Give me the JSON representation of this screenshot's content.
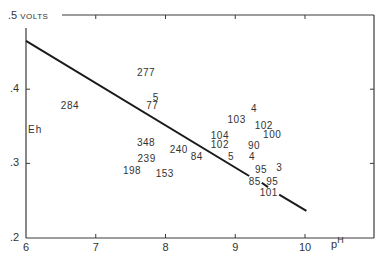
{
  "chart_data": {
    "type": "scatter",
    "title": "",
    "xlabel": "pH",
    "ylabel": "Eh",
    "y_unit_label": "VOLTS",
    "xlim": [
      6,
      10.99
    ],
    "ylim": [
      0.2,
      0.5
    ],
    "x_ticks": [
      "6",
      "7",
      "8",
      "9",
      "10"
    ],
    "y_ticks": [
      ".2",
      ".3",
      ".4",
      ".5"
    ],
    "grid": false,
    "legend": "none",
    "points": [
      {
        "label": "284",
        "x": 6.63,
        "y": 0.378
      },
      {
        "label": "277",
        "x": 7.72,
        "y": 0.422
      },
      {
        "label": "5",
        "x": 7.86,
        "y": 0.388
      },
      {
        "label": "77",
        "x": 7.81,
        "y": 0.377
      },
      {
        "label": "348",
        "x": 7.72,
        "y": 0.327
      },
      {
        "label": "239",
        "x": 7.73,
        "y": 0.306
      },
      {
        "label": "198",
        "x": 7.52,
        "y": 0.29
      },
      {
        "label": "153",
        "x": 7.99,
        "y": 0.286
      },
      {
        "label": "240",
        "x": 8.19,
        "y": 0.318
      },
      {
        "label": "84",
        "x": 8.45,
        "y": 0.309
      },
      {
        "label": "104",
        "x": 8.78,
        "y": 0.337
      },
      {
        "label": "102",
        "x": 8.78,
        "y": 0.325
      },
      {
        "label": "5",
        "x": 8.94,
        "y": 0.309
      },
      {
        "label": "103",
        "x": 9.02,
        "y": 0.358
      },
      {
        "label": "4",
        "x": 9.27,
        "y": 0.373
      },
      {
        "label": "102",
        "x": 9.41,
        "y": 0.35
      },
      {
        "label": "100",
        "x": 9.53,
        "y": 0.338
      },
      {
        "label": "90",
        "x": 9.27,
        "y": 0.323
      },
      {
        "label": "4",
        "x": 9.24,
        "y": 0.309
      },
      {
        "label": "95",
        "x": 9.37,
        "y": 0.291
      },
      {
        "label": "3",
        "x": 9.63,
        "y": 0.294
      },
      {
        "label": "85",
        "x": 9.28,
        "y": 0.275
      },
      {
        "label": "95",
        "x": 9.53,
        "y": 0.275
      },
      {
        "label": "101",
        "x": 9.48,
        "y": 0.26
      }
    ],
    "lines": [
      {
        "name": "boundary",
        "x": [
          6.0,
          9.2
        ],
        "y": [
          0.465,
          0.283
        ]
      },
      {
        "name": "boundary-dash",
        "x": [
          9.38,
          9.47
        ],
        "y": [
          0.274,
          0.268
        ]
      },
      {
        "name": "boundary-end",
        "x": [
          9.63,
          10.02
        ],
        "y": [
          0.258,
          0.236
        ]
      }
    ]
  }
}
